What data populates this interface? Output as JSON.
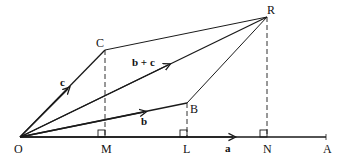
{
  "diagram": {
    "type": "vector-parallelogram-projection",
    "colors": {
      "line": "#1a1a1a",
      "background": "#ffffff"
    },
    "points": {
      "O": {
        "label": "O",
        "x": 20,
        "y": 137
      },
      "C": {
        "label": "C",
        "x": 105,
        "y": 50
      },
      "R": {
        "label": "R",
        "x": 267,
        "y": 17
      },
      "B": {
        "label": "B",
        "x": 187,
        "y": 103
      },
      "M": {
        "label": "M",
        "x": 105,
        "y": 137
      },
      "L": {
        "label": "L",
        "x": 187,
        "y": 137
      },
      "N": {
        "label": "N",
        "x": 267,
        "y": 137
      },
      "A": {
        "label": "A",
        "x": 326,
        "y": 137
      }
    },
    "vectors": {
      "a": {
        "label": "a",
        "from": "O",
        "to": "A"
      },
      "b": {
        "label": "b",
        "from": "O",
        "to": "B"
      },
      "c": {
        "label": "c",
        "from": "O",
        "to": "C"
      },
      "b_plus_c": {
        "label": "b + c",
        "from": "O",
        "to": "R"
      }
    },
    "segments": [
      {
        "from": "C",
        "to": "R",
        "style": "solid"
      },
      {
        "from": "B",
        "to": "R",
        "style": "solid"
      },
      {
        "from": "C",
        "to": "M",
        "style": "dashed"
      },
      {
        "from": "B",
        "to": "L",
        "style": "dashed"
      },
      {
        "from": "R",
        "to": "N",
        "style": "dashed"
      }
    ],
    "right_angle_markers": [
      "M",
      "L",
      "N"
    ]
  }
}
